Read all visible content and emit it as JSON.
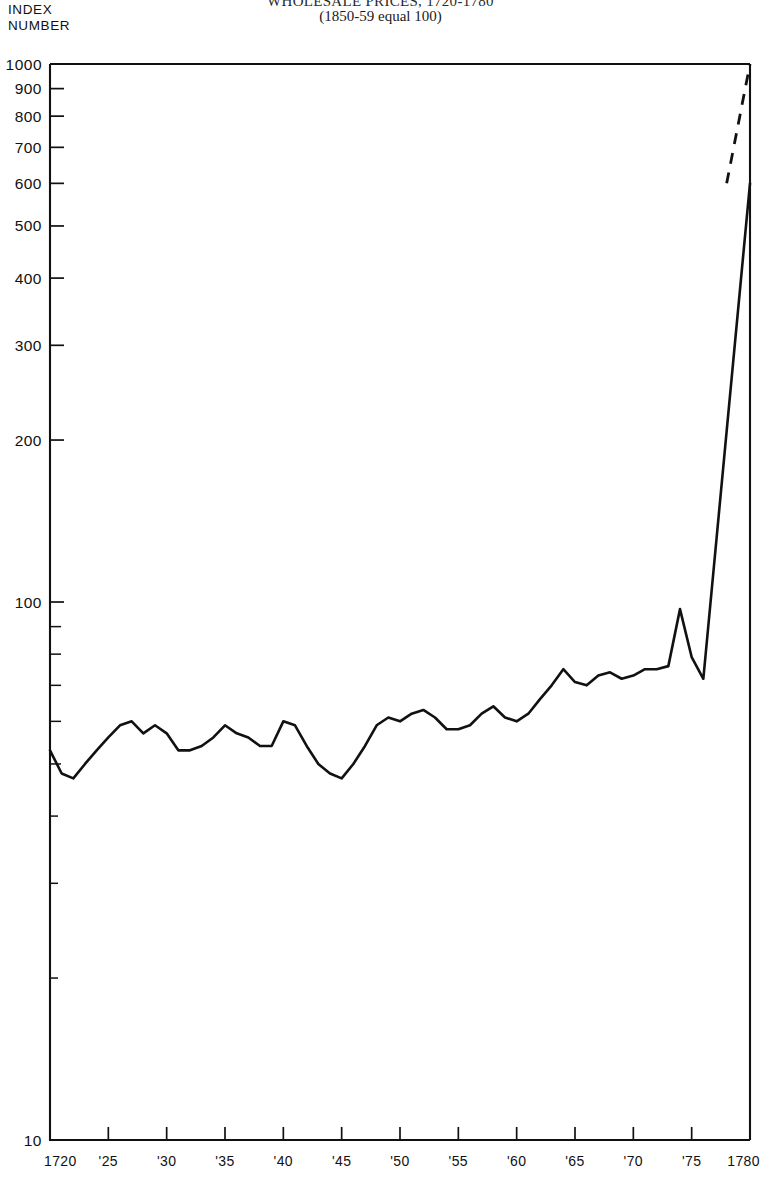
{
  "figure": {
    "title": "WHOLESALE PRICES, 1720-1780",
    "subtitle": "(1850-59 equal 100)",
    "y_axis_caption_line1": "INDEX",
    "y_axis_caption_line2": "NUMBER"
  },
  "chart_data": {
    "type": "line",
    "title": "WHOLESALE PRICES, 1720-1780",
    "subtitle": "(1850-59 equal 100)",
    "xlabel": "",
    "ylabel": "INDEX NUMBER",
    "yscale": "log",
    "ylim": [
      10,
      1000
    ],
    "xlim": [
      1720,
      1780
    ],
    "grid": false,
    "legend": null,
    "y_major_ticks": [
      10,
      100,
      200,
      300,
      400,
      500,
      600,
      700,
      800,
      900,
      1000
    ],
    "y_major_tick_labels": [
      "10",
      "100",
      "200",
      "300",
      "400",
      "500",
      "600",
      "700",
      "800",
      "900",
      "1000"
    ],
    "y_minor_ticks": [
      20,
      30,
      40,
      50,
      60,
      70,
      80,
      90
    ],
    "x_ticks": [
      1720,
      1725,
      1730,
      1735,
      1740,
      1745,
      1750,
      1755,
      1760,
      1765,
      1770,
      1775,
      1780
    ],
    "x_tick_labels": [
      "1720",
      "'25",
      "'30",
      "'35",
      "'40",
      "'45",
      "'50",
      "'55",
      "'60",
      "'65",
      "'70",
      "'75",
      "1780"
    ],
    "series": [
      {
        "name": "Wholesale price index",
        "style": "solid",
        "x": [
          1720,
          1721,
          1722,
          1723,
          1724,
          1725,
          1726,
          1727,
          1728,
          1729,
          1730,
          1731,
          1732,
          1733,
          1734,
          1735,
          1736,
          1737,
          1738,
          1739,
          1740,
          1741,
          1742,
          1743,
          1744,
          1745,
          1746,
          1747,
          1748,
          1749,
          1750,
          1751,
          1752,
          1753,
          1754,
          1755,
          1756,
          1757,
          1758,
          1759,
          1760,
          1761,
          1762,
          1763,
          1764,
          1765,
          1766,
          1767,
          1768,
          1769,
          1770,
          1771,
          1772,
          1773,
          1774,
          1775,
          1776,
          1780
        ],
        "y": [
          53,
          48,
          47,
          50,
          53,
          56,
          59,
          60,
          57,
          59,
          57,
          53,
          53,
          54,
          56,
          59,
          57,
          56,
          54,
          54,
          60,
          59,
          54,
          50,
          48,
          47,
          50,
          54,
          59,
          61,
          60,
          62,
          63,
          61,
          58,
          58,
          59,
          62,
          64,
          61,
          60,
          62,
          66,
          70,
          75,
          71,
          70,
          73,
          74,
          72,
          73,
          75,
          75,
          76,
          97,
          79,
          72,
          600
        ]
      },
      {
        "name": "Wholesale price index (projected)",
        "style": "dashed",
        "x": [
          1778,
          1780
        ],
        "y": [
          600,
          1000
        ]
      }
    ],
    "annotations": [
      {
        "text": "steep rise after 1776",
        "x": 1777,
        "y": 400
      }
    ]
  }
}
